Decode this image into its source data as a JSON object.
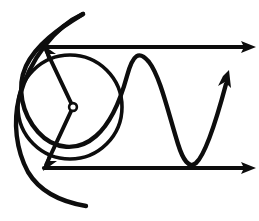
{
  "figure": {
    "background_color": "#ffffff",
    "ink_color": "#0d0d0d",
    "canvas": {
      "width": 259,
      "height": 221
    }
  },
  "elements": {
    "top_axis": {
      "name": "top horizontal arrow",
      "y": 47,
      "x_start": 44,
      "x_end": 246,
      "stroke_width": 4.2,
      "arrow_direction": "right",
      "arrow_tip_x": 254,
      "arrow_tip_y": 47
    },
    "bottom_axis": {
      "name": "bottom horizontal arrow",
      "y": 168,
      "x_start": 44,
      "x_end": 246,
      "stroke_width": 4.2,
      "arrow_direction": "right",
      "arrow_tip_x": 254,
      "arrow_tip_y": 168
    },
    "circle": {
      "name": "large circle",
      "center_x": 70,
      "center_y": 107,
      "radius": 52,
      "stroke_width": 3.6
    },
    "center_dot": {
      "name": "hollow center point",
      "center_x": 73,
      "center_y": 107,
      "outer_radius": 5.2,
      "inner_radius": 2.6
    },
    "radius_upper": {
      "name": "upper radius with arrowhead",
      "x_start": 73,
      "y_start": 107,
      "x_end": 46,
      "y_end": 50,
      "stroke_width": 4.0,
      "arrow_tip_x": 44,
      "arrow_tip_y": 47
    },
    "radius_lower": {
      "name": "lower radius with arrowhead",
      "x_start": 73,
      "y_start": 107,
      "x_end": 46,
      "y_end": 165,
      "stroke_width": 4.0,
      "arrow_tip_x": 44,
      "arrow_tip_y": 168
    },
    "sine_wave": {
      "name": "sine wave curve with arrowhead",
      "stroke_width": 4.4,
      "start_x": 83,
      "start_y": 14,
      "leftmost_x": 16,
      "trough_x": 185,
      "trough_y": 168,
      "arrow_tip_x": 229,
      "arrow_tip_y": 71,
      "arrow_direction": "up-right"
    },
    "left_arc": {
      "name": "left outer arc",
      "stroke_width": 4.4,
      "top_x": 83,
      "top_y": 14,
      "bottom_x": 86,
      "bottom_y": 206,
      "leftmost_x": 16,
      "leftmost_y": 110
    }
  }
}
